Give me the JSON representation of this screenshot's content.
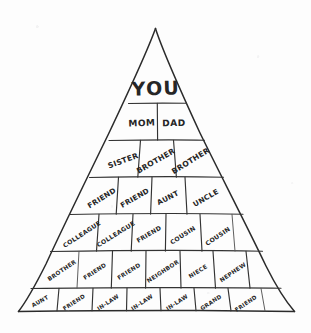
{
  "diagram": {
    "title_text": "YOU",
    "style": "hand-drawn pencil sketch on white paper",
    "shape": "triangle-pyramid",
    "ink_color": "#2b2b2b",
    "paper_color": "#fdfdfd",
    "row_count": 7,
    "rows": [
      {
        "index": 1,
        "label": "apex",
        "cells": [
          "YOU"
        ]
      },
      {
        "index": 2,
        "label": "row-2",
        "cells": [
          "MOM",
          "DAD"
        ]
      },
      {
        "index": 3,
        "label": "row-3",
        "cells": [
          "SISTER",
          "BROTHER",
          "BROTHER"
        ]
      },
      {
        "index": 4,
        "label": "row-4",
        "cells": [
          "FRIEND",
          "FRIEND",
          "AUNT",
          "UNCLE"
        ]
      },
      {
        "index": 5,
        "label": "row-5",
        "cells": [
          "COLLEAGUE",
          "COLLEAGUE",
          "FRIEND",
          "COUSIN",
          "COUSIN"
        ]
      },
      {
        "index": 6,
        "label": "row-6",
        "cells": [
          "BROTHER",
          "FRIEND",
          "FRIEND",
          "NEIGHBOR",
          "NIECE",
          "NEPHEW"
        ]
      },
      {
        "index": 7,
        "label": "row-7",
        "cells": [
          "AUNT",
          "FRIEND",
          "IN-LAW",
          "IN-LAW",
          "IN-LAW",
          "GRAND",
          "FRIEND"
        ]
      }
    ]
  }
}
